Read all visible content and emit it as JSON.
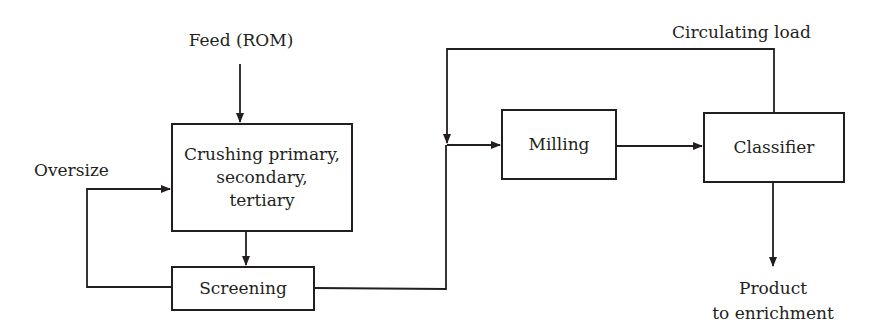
{
  "diagram": {
    "type": "process-flow",
    "nodes": {
      "crushing": {
        "label": "Crushing primary,\nsecondary,\ntertiary"
      },
      "screening": {
        "label": "Screening"
      },
      "milling": {
        "label": "Milling"
      },
      "classifier": {
        "label": "Classifier"
      }
    },
    "labels": {
      "feed": "Feed (ROM)",
      "oversize": "Oversize",
      "circulating_load": "Circulating load",
      "product_line1": "Product",
      "product_line2": "to enrichment"
    },
    "edges": [
      {
        "from": "Feed (ROM)",
        "to": "crushing"
      },
      {
        "from": "crushing",
        "to": "screening"
      },
      {
        "from": "screening",
        "to": "crushing",
        "label": "Oversize"
      },
      {
        "from": "screening",
        "to": "milling"
      },
      {
        "from": "milling",
        "to": "classifier"
      },
      {
        "from": "classifier",
        "to": "milling",
        "label": "Circulating load"
      },
      {
        "from": "classifier",
        "to": "Product to enrichment"
      }
    ],
    "colors": {
      "line": "#231f20",
      "background": "#ffffff"
    }
  }
}
